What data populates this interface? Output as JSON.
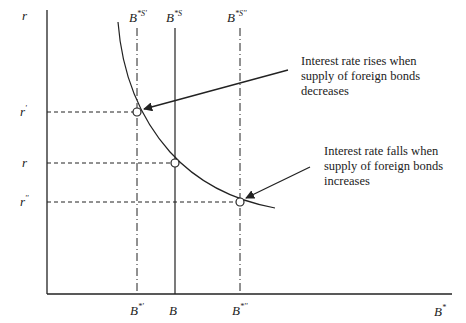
{
  "axes": {
    "y_label": "r",
    "x_label": "B",
    "x_label_sup": "*"
  },
  "y_ticks": [
    {
      "id": "r-prime",
      "base": "r",
      "sup": "'"
    },
    {
      "id": "r",
      "base": "r",
      "sup": ""
    },
    {
      "id": "r-double-prime",
      "base": "r",
      "sup": "''"
    }
  ],
  "x_ticks": [
    {
      "id": "b-star-prime",
      "base": "B",
      "sup": "*'"
    },
    {
      "id": "b",
      "base": "B",
      "sup": ""
    },
    {
      "id": "b-star-double-prime",
      "base": "B",
      "sup": "*''"
    }
  ],
  "supply_lines": [
    {
      "id": "bsupply-prime",
      "base": "B",
      "sup": "*S'"
    },
    {
      "id": "bsupply",
      "base": "B",
      "sup": "*S"
    },
    {
      "id": "bsupply-double-prime",
      "base": "B",
      "sup": "*S''"
    }
  ],
  "annotations": {
    "rise": [
      "Interest rate rises when",
      "supply of foreign bonds",
      "decreases"
    ],
    "fall": [
      "Interest rate falls when",
      "supply of foreign bonds",
      "increases"
    ]
  },
  "colors": {
    "line": "#222222",
    "background": "#ffffff"
  }
}
